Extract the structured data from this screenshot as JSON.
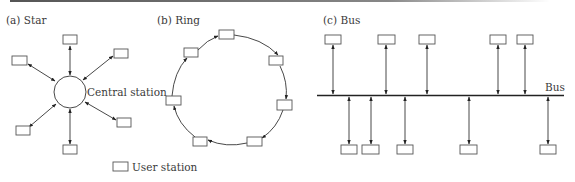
{
  "figure": {
    "panels": [
      {
        "id": "a",
        "label": "(a) Star"
      },
      {
        "id": "b",
        "label": "(b) Ring"
      },
      {
        "id": "c",
        "label": "(c) Bus"
      }
    ],
    "star": {
      "center_label": "Central station",
      "stations": 8
    },
    "ring": {
      "stations": 7,
      "direction": "clockwise"
    },
    "bus": {
      "bus_label": "Bus",
      "stations_above": 5,
      "stations_below": 5
    },
    "legend": {
      "label": "User station"
    },
    "colors": {
      "line": "#333333",
      "box_stroke": "#555555",
      "text": "#3a3a3a"
    }
  }
}
